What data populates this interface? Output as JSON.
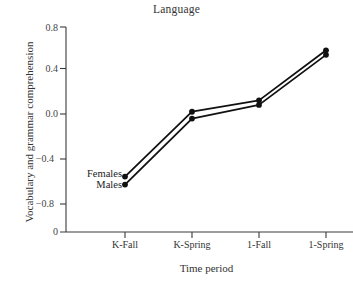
{
  "chart_data": {
    "type": "line",
    "title": "Language",
    "xlabel": "Time period",
    "ylabel": "Vocabulary and grammar comprehension",
    "categories": [
      "K-Fall",
      "K-Spring",
      "1-Fall",
      "1-Spring"
    ],
    "yticks": [
      "0.8",
      "0.4",
      "0.0",
      "−0.4",
      "−0.8"
    ],
    "ytick_values": [
      0.8,
      0.4,
      0.0,
      -0.4,
      -0.8
    ],
    "axis_origin_label": "0",
    "ylim": [
      -0.8,
      0.8
    ],
    "grid": false,
    "legend_position": "inline-left",
    "marker": "filled-circle",
    "line_color": "#111111",
    "series": [
      {
        "name": "Females",
        "values": [
          -0.55,
          0.02,
          0.12,
          0.56
        ]
      },
      {
        "name": "Males",
        "values": [
          -0.62,
          -0.04,
          0.08,
          0.52
        ]
      }
    ]
  },
  "labels": {
    "females": "Females",
    "males": "Males"
  }
}
